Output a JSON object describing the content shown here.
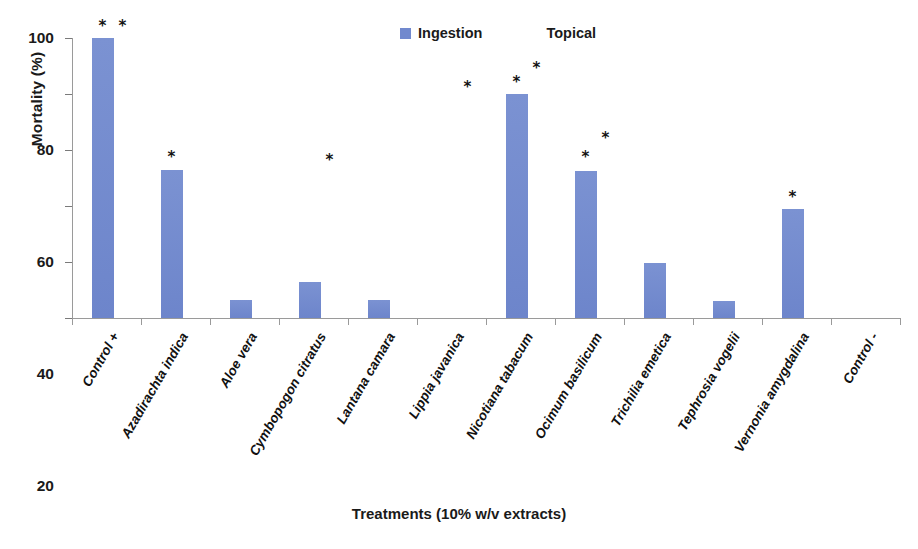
{
  "chart_data": {
    "type": "bar",
    "title": "",
    "xlabel": "Treatments (10% w/v extracts)",
    "ylabel": "Mortality (%)",
    "ylim": [
      0,
      100
    ],
    "ytick_labels": [
      "0",
      "20",
      "40",
      "60",
      "80",
      "100"
    ],
    "ytick_values": [
      0,
      20,
      40,
      60,
      80,
      100
    ],
    "grid": false,
    "legend_position": "top-center",
    "categories": [
      "Control +",
      "Azadirachta indica",
      "Aloe vera",
      "Cymbopogon citratus",
      "Lantana camara",
      "Lippia javanica",
      "Nicotiana tabacum",
      "Ocimum basilicum",
      "Trichilia emetica",
      "Tephrosia vogelii",
      "Vernonia amygdalina",
      "Control -"
    ],
    "series": [
      {
        "name": "Ingestion",
        "color": "#7189ce",
        "values": [
          100,
          53,
          6.5,
          13,
          6.5,
          0,
          80,
          52.5,
          19.5,
          6,
          39,
          0
        ]
      },
      {
        "name": "Topical",
        "color": "#ffffff",
        "values": [
          0,
          0,
          0,
          0,
          0,
          0,
          0,
          0,
          0,
          0,
          0,
          0
        ]
      }
    ],
    "annotations": [
      {
        "label": "*",
        "category": "Control +",
        "series": "Ingestion",
        "y": 104
      },
      {
        "label": "*",
        "category": "Control +",
        "series": "Topical",
        "y": 104
      },
      {
        "label": "*",
        "category": "Azadirachta indica",
        "series": "Ingestion",
        "y": 57
      },
      {
        "label": "*",
        "category": "Cymbopogon citratus",
        "series": "Topical",
        "y": 56
      },
      {
        "label": "*",
        "category": "Lippia javanica",
        "series": "Topical",
        "y": 82
      },
      {
        "label": "*",
        "category": "Nicotiana tabacum",
        "series": "Ingestion",
        "y": 84
      },
      {
        "label": "*",
        "category": "Nicotiana tabacum",
        "series": "Topical",
        "y": 89
      },
      {
        "label": "*",
        "category": "Ocimum basilicum",
        "series": "Ingestion",
        "y": 57
      },
      {
        "label": "*",
        "category": "Ocimum basilicum",
        "series": "Topical",
        "y": 64
      },
      {
        "label": "*",
        "category": "Vernonia amygdalina",
        "series": "Ingestion",
        "y": 43
      }
    ]
  },
  "legend": {
    "items": [
      {
        "label": "Ingestion",
        "swatch": "filled"
      },
      {
        "label": "Topical",
        "swatch": "blank"
      }
    ]
  }
}
